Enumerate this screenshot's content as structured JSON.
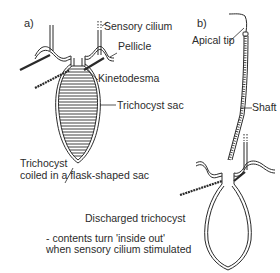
{
  "figure": {
    "panel_a": {
      "label": "a)",
      "labels": {
        "sensory_cilium": "Sensory cilium",
        "pellicle": "Pellicle",
        "kinetodesma": "Kinetodesma",
        "trichocyst_sac": "Trichocyst sac",
        "caption_line1": "Trichocyst",
        "caption_line2": "coiled in a flask-shaped sac"
      }
    },
    "panel_b": {
      "label": "b)",
      "labels": {
        "apical_tip": "Apical tip",
        "shaft": "Shaft",
        "discharged": "Discharged trichocyst",
        "note_line1": "- contents turn 'inside out'",
        "note_line2": "when sensory cilium stimulated"
      }
    },
    "colors": {
      "ink": "#2a2a2a",
      "background": "#ffffff"
    }
  }
}
